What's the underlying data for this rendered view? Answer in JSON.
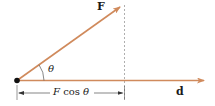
{
  "diagram": {
    "force_label": "F",
    "displacement_label": "d",
    "angle_label": "θ",
    "projection_label": {
      "F": "F",
      "cos": " cos ",
      "theta": "θ"
    },
    "colors": {
      "vector": "#d08a5c",
      "dashed": "#9a9a9a",
      "point": "#111111",
      "text": "#1a1a1a"
    }
  }
}
